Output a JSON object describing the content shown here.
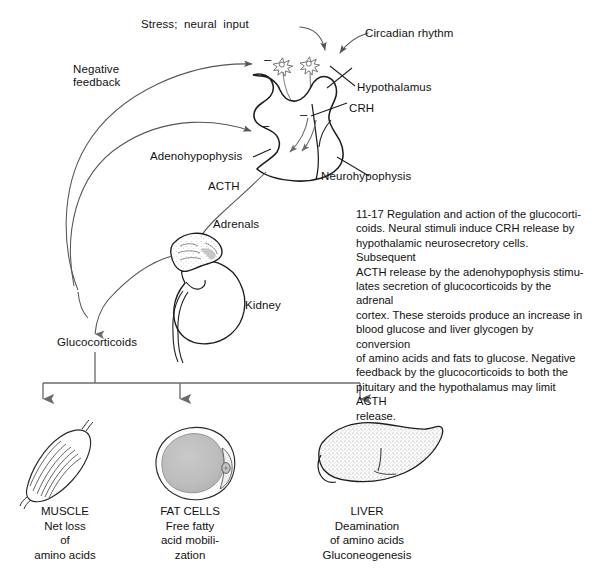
{
  "figure": {
    "background": "#ffffff",
    "ink": "#1a1a1a",
    "line_color": "#555555"
  },
  "caption": {
    "number": "11-17",
    "text": "11-17   Regulation and action of the glucocorti-\ncoids. Neural stimuli induce CRH release by\nhypothalamic neurosecretory cells. Subsequent\nACTH release by the adenohypophysis stimu-\nlates secretion of glucocorticoids by the adrenal\ncortex. These steroids produce an increase in\nblood glucose and liver glycogen by conversion\nof amino acids and fats to glucose. Negative\nfeedback by the glucocorticoids to both the\npituitary and the hypothalamus may limit ACTH\nrelease."
  },
  "labels": {
    "stress": "Stress;  neural  input",
    "circadian": "Circadian rhythm",
    "negative_feedback": "Negative\nfeedback",
    "hypothalamus": "Hypothalamus",
    "crh": "CRH",
    "adenohypophysis": "Adenohypophysis",
    "neurohypophysis": "Neurohypophysis",
    "acth": "ACTH",
    "adrenals": "Adrenals",
    "kidney": "Kidney",
    "glucocorticoids": "Glucocorticoids"
  },
  "inhibition_signs": {
    "glyph": "–",
    "count": 3,
    "meaning": "negative-feedback-minus-sign"
  },
  "targets": [
    {
      "id": "muscle",
      "organ": "MUSCLE",
      "effect": "Net loss\nof\namino acids",
      "caption": "MUSCLE\nNet loss\nof\namino acids"
    },
    {
      "id": "fat-cells",
      "organ": "FAT  CELLS",
      "effect": "Free fatty\nacid mobili-\nzation",
      "caption": "FAT  CELLS\nFree fatty\nacid mobili-\nzation"
    },
    {
      "id": "liver",
      "organ": "LIVER",
      "effect": "Deamination\nof  amino acids\nGluconeogenesis",
      "caption": "LIVER\nDeamination\nof  amino acids\nGluconeogenesis"
    }
  ]
}
